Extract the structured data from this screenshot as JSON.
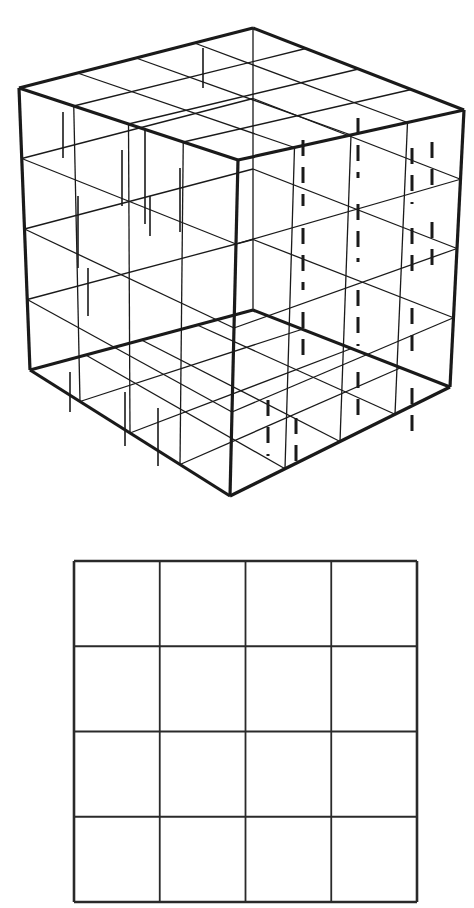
{
  "figure": {
    "background_color": "#ffffff",
    "ink_color": "#1a1a1a"
  },
  "cube": {
    "name": "wireframe-cube",
    "divisions": 4,
    "projection": "isometric",
    "stroke_color": "#1a1a1a",
    "outline_width": 3.2,
    "grid_width": 1.3,
    "tick_width": 1.6,
    "dash_width": 3.0,
    "vertices": {
      "top": [
        253,
        28
      ],
      "left_top": [
        19,
        88
      ],
      "right_top": [
        464,
        110
      ],
      "front_top": [
        238,
        160
      ],
      "left_bottom": [
        30,
        370
      ],
      "right_bottom": [
        450,
        387
      ],
      "front_bottom": [
        230,
        496
      ],
      "back_bottom": [
        253,
        310
      ]
    },
    "left_face_ticks": [
      {
        "x": 63,
        "y": 112,
        "len": 46
      },
      {
        "x": 78,
        "y": 196,
        "len": 72
      },
      {
        "x": 88,
        "y": 268,
        "len": 48
      },
      {
        "x": 145,
        "y": 128,
        "len": 96
      },
      {
        "x": 150,
        "y": 196,
        "len": 40
      },
      {
        "x": 122,
        "y": 150,
        "len": 56
      },
      {
        "x": 180,
        "y": 168,
        "len": 64
      },
      {
        "x": 203,
        "y": 48,
        "len": 40
      },
      {
        "x": 70,
        "y": 372,
        "len": 40
      },
      {
        "x": 125,
        "y": 392,
        "len": 54
      },
      {
        "x": 158,
        "y": 408,
        "len": 58
      }
    ],
    "right_face_dashes": [
      {
        "x": 303,
        "y": 140,
        "len": 66
      },
      {
        "x": 303,
        "y": 228,
        "len": 62
      },
      {
        "x": 303,
        "y": 312,
        "len": 54
      },
      {
        "x": 358,
        "y": 118,
        "len": 60
      },
      {
        "x": 358,
        "y": 204,
        "len": 58
      },
      {
        "x": 358,
        "y": 290,
        "len": 56
      },
      {
        "x": 358,
        "y": 372,
        "len": 50
      },
      {
        "x": 412,
        "y": 148,
        "len": 56
      },
      {
        "x": 412,
        "y": 228,
        "len": 54
      },
      {
        "x": 412,
        "y": 308,
        "len": 52
      },
      {
        "x": 412,
        "y": 388,
        "len": 48
      },
      {
        "x": 432,
        "y": 142,
        "len": 52
      },
      {
        "x": 432,
        "y": 222,
        "len": 50
      },
      {
        "x": 268,
        "y": 400,
        "len": 56
      },
      {
        "x": 296,
        "y": 418,
        "len": 48
      }
    ]
  },
  "square_grid": {
    "name": "square-grid",
    "rows": 4,
    "columns": 4,
    "left": 74,
    "top": 561,
    "width": 343,
    "height": 341,
    "border_width": 2.6,
    "line_width": 1.8,
    "stroke_color": "#2a2a2a"
  }
}
